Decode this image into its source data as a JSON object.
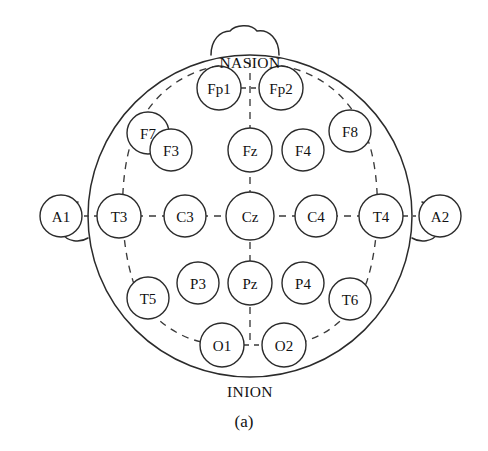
{
  "figure": {
    "caption": "(a)",
    "caption_x": 244,
    "caption_y": 421,
    "background_color": "#ffffff",
    "stroke_color": "#2b2b2b",
    "dash_color": "#3a3a3a",
    "text_color": "#111111"
  },
  "head": {
    "center_x": 250,
    "center_y": 216,
    "radius_x": 162,
    "radius_y": 161
  },
  "anatomy_labels": [
    {
      "id": "nasion",
      "text": "NASION",
      "x": 250,
      "y": 62
    },
    {
      "id": "inion",
      "text": "INION",
      "x": 250,
      "y": 391
    }
  ],
  "electrodes": [
    {
      "id": "Fp1",
      "label": "Fp1",
      "x": 219,
      "y": 88,
      "r": 22
    },
    {
      "id": "Fp2",
      "label": "Fp2",
      "x": 281,
      "y": 88,
      "r": 22
    },
    {
      "id": "F7",
      "label": "F7",
      "x": 148,
      "y": 133,
      "r": 21
    },
    {
      "id": "F3",
      "label": "F3",
      "x": 171,
      "y": 150,
      "r": 21
    },
    {
      "id": "Fz",
      "label": "Fz",
      "x": 250,
      "y": 150,
      "r": 22
    },
    {
      "id": "F4",
      "label": "F4",
      "x": 303,
      "y": 150,
      "r": 21
    },
    {
      "id": "F8",
      "label": "F8",
      "x": 350,
      "y": 131,
      "r": 21
    },
    {
      "id": "A1",
      "label": "A1",
      "x": 61,
      "y": 216,
      "r": 21
    },
    {
      "id": "T3",
      "label": "T3",
      "x": 119,
      "y": 216,
      "r": 22
    },
    {
      "id": "C3",
      "label": "C3",
      "x": 185,
      "y": 216,
      "r": 21
    },
    {
      "id": "Cz",
      "label": "Cz",
      "x": 250,
      "y": 216,
      "r": 24
    },
    {
      "id": "C4",
      "label": "C4",
      "x": 316,
      "y": 216,
      "r": 21
    },
    {
      "id": "T4",
      "label": "T4",
      "x": 381,
      "y": 216,
      "r": 22
    },
    {
      "id": "A2",
      "label": "A2",
      "x": 440,
      "y": 216,
      "r": 21
    },
    {
      "id": "T5",
      "label": "T5",
      "x": 148,
      "y": 298,
      "r": 21
    },
    {
      "id": "P3",
      "label": "P3",
      "x": 198,
      "y": 283,
      "r": 21
    },
    {
      "id": "Pz",
      "label": "Pz",
      "x": 250,
      "y": 283,
      "r": 22
    },
    {
      "id": "P4",
      "label": "P4",
      "x": 303,
      "y": 283,
      "r": 21
    },
    {
      "id": "T6",
      "label": "T6",
      "x": 350,
      "y": 299,
      "r": 21
    },
    {
      "id": "O1",
      "label": "O1",
      "x": 222,
      "y": 345,
      "r": 22
    },
    {
      "id": "O2",
      "label": "O2",
      "x": 284,
      "y": 345,
      "r": 22
    }
  ],
  "geometry": {
    "nose_path": "M 211 55 C 211 40 220 31 230 31 C 235 25 251 23 257 31 C 269 29 279 39 279 55",
    "ear_left_path": "M 78 202 C 60 205 55 222 62 233 C 67 242 80 243 88 238",
    "ear_right_path": "M 422 202 C 440 205 445 222 438 233 C 433 242 420 243 412 238",
    "ring_left_path": "M 219 66 C 178 72 145 101 131 143 C 119 181 120 241 133 281 C 146 318 180 343 222 345",
    "ring_right_path": "M 281 66 C 322 72 355 101 369 143 C 381 181 380 241 367 281 C 354 318 320 343 284 345",
    "midline_top_path": "M 250 60 L 250 345",
    "central_row_path": "M 97 216 L 403 216",
    "fp_bridge_path": "M 241 88 L 259 88",
    "o_bridge_path": "M 244 345 L 262 345",
    "ear_tick_left_path": "M 84 216 L 97 216",
    "ear_tick_right_path": "M 403 216 L 416 216"
  }
}
